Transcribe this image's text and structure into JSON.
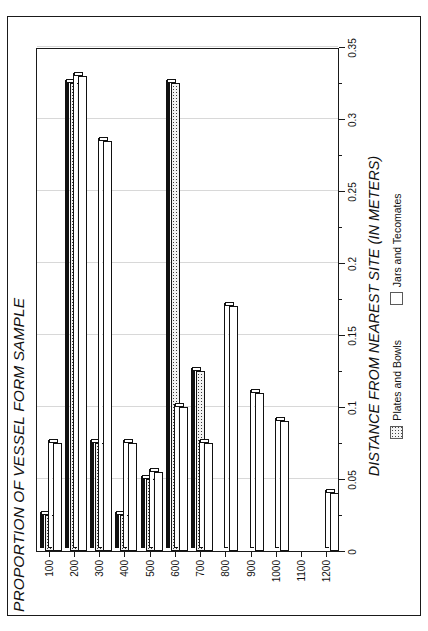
{
  "figure": {
    "title": "PROPORTION OF VESSEL FORM SAMPLE",
    "xlabel": "DISTANCE FROM NEAREST SITE (IN METERS)",
    "annotation_line1": "Plates and Bowls: N = 40",
    "annotation_line2": "Jars and Tecomates: N = 53",
    "annotation_n1": "40",
    "annotation_n2": "53"
  },
  "legend": {
    "position": "bottom",
    "items": [
      {
        "label": "Plates and Bowls",
        "swatch": "dotted-square"
      },
      {
        "label": "Jars and Tecomates",
        "swatch": "white-square"
      }
    ]
  },
  "colors": {
    "ink": "#1a1a1a",
    "grid": "#d8d8d8",
    "plates_fill": "#f2f2f2",
    "jars_fill": "#ffffff"
  },
  "chart_data": {
    "type": "bar",
    "orientation": "horizontal",
    "title": "PROPORTION OF VESSEL FORM SAMPLE",
    "xlabel": "PROPORTION OF VESSEL FORM SAMPLE",
    "ylabel": "DISTANCE FROM NEAREST SITE (IN METERS)",
    "categories": [
      "100",
      "200",
      "300",
      "400",
      "500",
      "600",
      "700",
      "800",
      "900",
      "1000",
      "1100",
      "1200"
    ],
    "value_ticks": [
      "0",
      "0.05",
      "0.1",
      "0.15",
      "0.2",
      "0.25",
      "0.3",
      "0.35"
    ],
    "value_tick_numbers": [
      0,
      0.05,
      0.1,
      0.15,
      0.2,
      0.25,
      0.3,
      0.35
    ],
    "xlim": [
      0,
      0.35
    ],
    "grid": true,
    "legend_position": "bottom",
    "series": [
      {
        "name": "Plates and Bowls",
        "n": 40,
        "values": [
          0.025,
          0.325,
          0.075,
          0.025,
          0.05,
          0.325,
          0.125,
          0,
          0,
          0,
          0,
          0
        ]
      },
      {
        "name": "Jars and Tecomates",
        "n": 53,
        "values": [
          0.075,
          0.33,
          0.285,
          0.075,
          0.055,
          0.1,
          0.075,
          0.17,
          0.11,
          0.09,
          0,
          0.04
        ]
      }
    ]
  }
}
